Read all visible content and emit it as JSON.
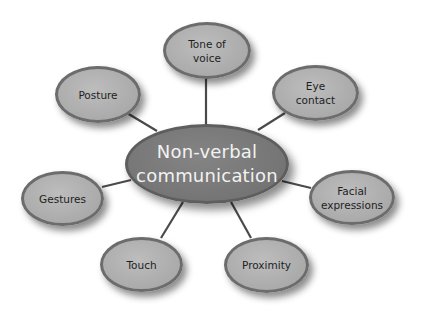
{
  "diagram": {
    "center": {
      "label": "Non-verbal\ncommunication",
      "fill": "#767676",
      "text_color": "#f2f2f2"
    },
    "nodes": [
      {
        "id": "tone-of-voice",
        "label": "Tone of\nvoice"
      },
      {
        "id": "eye-contact",
        "label": "Eye\ncontact"
      },
      {
        "id": "facial-expressions",
        "label": "Facial\nexpressions"
      },
      {
        "id": "proximity",
        "label": "Proximity"
      },
      {
        "id": "touch",
        "label": "Touch"
      },
      {
        "id": "gestures",
        "label": "Gestures"
      },
      {
        "id": "posture",
        "label": "Posture"
      }
    ],
    "node_fill": "#adadad",
    "node_border": "#6c6c6c",
    "connector_color": "#4a4a4a"
  }
}
